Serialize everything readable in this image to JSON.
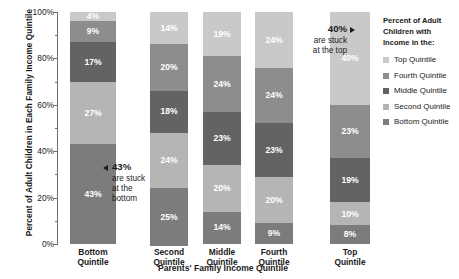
{
  "chart_data": {
    "type": "bar",
    "subtype": "stacked-bar-100",
    "title": "",
    "xlabel": "Parents' Family Income Quintile",
    "ylabel": "Percent of Adult Children in Each Family Income Quintile",
    "ylim": [
      0,
      100
    ],
    "yticks": [
      "0%",
      "20%",
      "40%",
      "60%",
      "80%",
      "100%"
    ],
    "ytick_values": [
      0,
      20,
      40,
      60,
      80,
      100
    ],
    "minor_ytick_values": [
      10,
      30,
      50,
      70,
      90
    ],
    "grid": false,
    "legend_position": "right",
    "legend_title": "Percent of Adult Children with Income in the:",
    "categories": [
      "Bottom Quintile",
      "Second Quintile",
      "Middle Quintile",
      "Fourth Quintile",
      "Top Quintile"
    ],
    "series": [
      {
        "name": "Top Quintile",
        "color": "#c9c9c9",
        "values": [
          4,
          14,
          19,
          24,
          40
        ]
      },
      {
        "name": "Fourth Quintile",
        "color": "#8d8d8d",
        "values": [
          9,
          20,
          24,
          24,
          23
        ]
      },
      {
        "name": "Middle Quintile",
        "color": "#636363",
        "values": [
          17,
          18,
          23,
          23,
          19
        ]
      },
      {
        "name": "Second Quintile",
        "color": "#b5b5b5",
        "values": [
          27,
          24,
          20,
          20,
          10
        ]
      },
      {
        "name": "Bottom Quintile",
        "color": "#7c7c7c",
        "values": [
          43,
          25,
          14,
          9,
          8
        ]
      }
    ],
    "annotations": [
      {
        "id": "stuck-at-bottom",
        "headline": "43%",
        "lines": [
          "are stuck",
          "at the",
          "bottom"
        ],
        "arrow": "left"
      },
      {
        "id": "stuck-at-top",
        "headline": "40%",
        "lines": [
          "are stuck",
          "at the top"
        ],
        "arrow": "right"
      }
    ]
  },
  "legend": {
    "title_lines": [
      "Percent of Adult",
      "Children with",
      "Income in the:"
    ],
    "items": [
      {
        "label": "Top Quintile",
        "color": "#c9c9c9"
      },
      {
        "label": "Fourth Quintile",
        "color": "#8d8d8d"
      },
      {
        "label": "Middle Quintile",
        "color": "#636363"
      },
      {
        "label": "Second Quintile",
        "color": "#b5b5b5"
      },
      {
        "label": "Bottom Quintile",
        "color": "#7c7c7c"
      }
    ]
  },
  "segment_labels": {
    "bottom": [
      "4%",
      "9%",
      "17%",
      "27%",
      "43%"
    ],
    "second": [
      "14%",
      "20%",
      "18%",
      "24%",
      "25%"
    ],
    "middle": [
      "19%",
      "24%",
      "23%",
      "20%",
      "14%"
    ],
    "fourth": [
      "24%",
      "24%",
      "23%",
      "20%",
      "9%"
    ],
    "top": [
      "40%",
      "23%",
      "19%",
      "10%",
      "8%"
    ]
  }
}
